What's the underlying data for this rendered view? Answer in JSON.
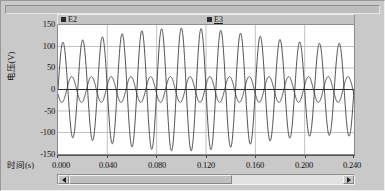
{
  "window": {
    "background_color": "#c9c9c9",
    "plot_background_color": "#ffffff",
    "grid_color": "#c0c0c0",
    "trace_color": "#3a3a3a"
  },
  "legend": {
    "entries": [
      {
        "label": "E2",
        "marker": "square-marker",
        "underlined": false
      },
      {
        "label": "E3",
        "marker": "square-marker",
        "underlined": true
      }
    ]
  },
  "scrollbar": {
    "left_arrow_icon": "triangle-left-icon",
    "right_arrow_icon": "triangle-right-icon",
    "thumb_position_percent": 0,
    "thumb_width_percent": 57
  },
  "chart_data": {
    "type": "line",
    "title": "",
    "xlabel": "时间(s)",
    "ylabel": "电压(V)",
    "xlim": [
      0.0,
      0.24
    ],
    "ylim": [
      -150,
      150
    ],
    "grid": true,
    "legend_position": "top-inside",
    "xticks": [
      "0.000",
      "0.040",
      "0.080",
      "0.120",
      "0.160",
      "0.200",
      "0.240"
    ],
    "xtick_values": [
      0.0,
      0.04,
      0.08,
      0.12,
      0.16,
      0.2,
      0.24
    ],
    "yticks": [
      "150",
      "100",
      "50",
      "0",
      "-50",
      "-100",
      "-150"
    ],
    "ytick_values": [
      150,
      100,
      50,
      0,
      -50,
      -100,
      -150
    ],
    "series": [
      {
        "name": "E2",
        "description": "large-amplitude sinusoid, amplitude approximately 125 V, frequency approximately 62.5 Hz",
        "amplitude": 125,
        "frequency_hz": 62.5,
        "phase_deg": 0,
        "drift_amplitude": 18,
        "drift_frequency_hz": 4.2
      },
      {
        "name": "E3",
        "description": "small-amplitude sinusoid, amplitude approximately 30 V, frequency approximately 62.5 Hz, phase shifted",
        "amplitude": 30,
        "frequency_hz": 62.5,
        "phase_deg": 200,
        "drift_amplitude": 0,
        "drift_frequency_hz": 0
      }
    ]
  }
}
